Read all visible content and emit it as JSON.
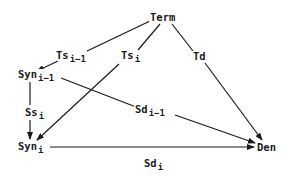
{
  "diagram": {
    "nodes": {
      "term": {
        "label": "Term",
        "sub": ""
      },
      "ts_prev": {
        "label": "Ts",
        "sub": "i−1"
      },
      "ts_i": {
        "label": "Ts",
        "sub": "i"
      },
      "td": {
        "label": "Td",
        "sub": ""
      },
      "syn_prev": {
        "label": "Syn",
        "sub": "i−1"
      },
      "ss_i": {
        "label": "Ss",
        "sub": "i"
      },
      "sd_prev": {
        "label": "Sd",
        "sub": "i−1"
      },
      "syn_i": {
        "label": "Syn",
        "sub": "i"
      },
      "den": {
        "label": "Den",
        "sub": ""
      },
      "sd_i": {
        "label": "Sd",
        "sub": "i"
      }
    },
    "edges": [
      {
        "from": "Term",
        "via": "Ts_{i-1}",
        "to": "Syn_{i-1}",
        "arrow": true
      },
      {
        "from": "Term",
        "via": "Ts_i",
        "to": "Syn_i",
        "arrow": true
      },
      {
        "from": "Term",
        "via": "Td",
        "to": "Den",
        "arrow": true
      },
      {
        "from": "Syn_{i-1}",
        "via": "Ss_i",
        "to": "Syn_i",
        "arrow": true
      },
      {
        "from": "Syn_{i-1}",
        "via": "Sd_{i-1}",
        "to": "Den",
        "arrow": true
      },
      {
        "from": "Syn_i",
        "via": "Sd_i",
        "to": "Den",
        "arrow": true
      }
    ],
    "colors": {
      "line": "#1a1a1a",
      "background": "#ffffff"
    }
  }
}
